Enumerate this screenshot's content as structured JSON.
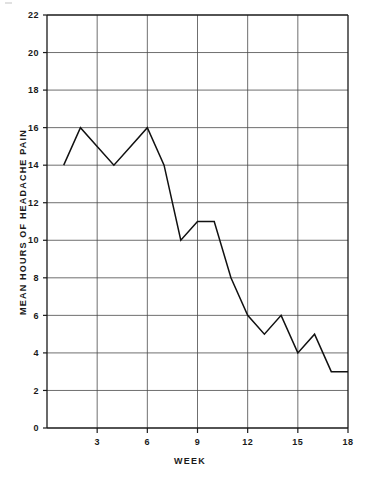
{
  "chart_data": {
    "type": "line",
    "title": "",
    "xlabel": "WEEK",
    "ylabel": "MEAN HOURS OF HEADACHE PAIN",
    "x": [
      1,
      2,
      3,
      4,
      5,
      6,
      7,
      8,
      9,
      10,
      11,
      12,
      13,
      14,
      15,
      16,
      17,
      18
    ],
    "values": [
      14,
      16,
      15,
      14,
      15,
      16,
      14,
      10,
      11,
      11,
      8,
      6,
      5,
      6,
      4,
      5,
      3,
      3
    ],
    "series": [
      {
        "name": "Mean hours of headache pain",
        "values": [
          14,
          16,
          15,
          14,
          15,
          16,
          14,
          10,
          11,
          11,
          8,
          6,
          5,
          6,
          4,
          5,
          3,
          3
        ]
      }
    ],
    "xlim": [
      0,
      18
    ],
    "ylim": [
      0,
      22
    ],
    "xticks": [
      3,
      6,
      9,
      12,
      15,
      18
    ],
    "yticks": [
      0,
      2,
      4,
      6,
      8,
      10,
      12,
      14,
      16,
      18,
      20,
      22
    ],
    "xtick_labels": [
      "3",
      "6",
      "9",
      "12",
      "15",
      "18"
    ],
    "ytick_labels": [
      "0",
      "2",
      "4",
      "6",
      "8",
      "10",
      "12",
      "14",
      "16",
      "18",
      "20",
      "22"
    ],
    "grid": true,
    "grid_axes": "both",
    "legend": false,
    "legend_position": "none",
    "line_color": "#111111",
    "grid_color": "#4a4a4a",
    "frame_color": "#1a1a1a",
    "background_color": "#ffffff"
  },
  "axes": {
    "y_title": "MEAN HOURS OF HEADACHE PAIN",
    "x_title": "WEEK"
  },
  "y_ticks": [
    {
      "label": "22",
      "value": 22
    },
    {
      "label": "20",
      "value": 20
    },
    {
      "label": "18",
      "value": 18
    },
    {
      "label": "16",
      "value": 16
    },
    {
      "label": "14",
      "value": 14
    },
    {
      "label": "12",
      "value": 12
    },
    {
      "label": "10",
      "value": 10
    },
    {
      "label": "8",
      "value": 8
    },
    {
      "label": "6",
      "value": 6
    },
    {
      "label": "4",
      "value": 4
    },
    {
      "label": "2",
      "value": 2
    },
    {
      "label": "0",
      "value": 0
    }
  ],
  "x_ticks": [
    {
      "label": "3",
      "value": 3
    },
    {
      "label": "6",
      "value": 6
    },
    {
      "label": "9",
      "value": 9
    },
    {
      "label": "12",
      "value": 12
    },
    {
      "label": "15",
      "value": 15
    },
    {
      "label": "18",
      "value": 18
    }
  ]
}
